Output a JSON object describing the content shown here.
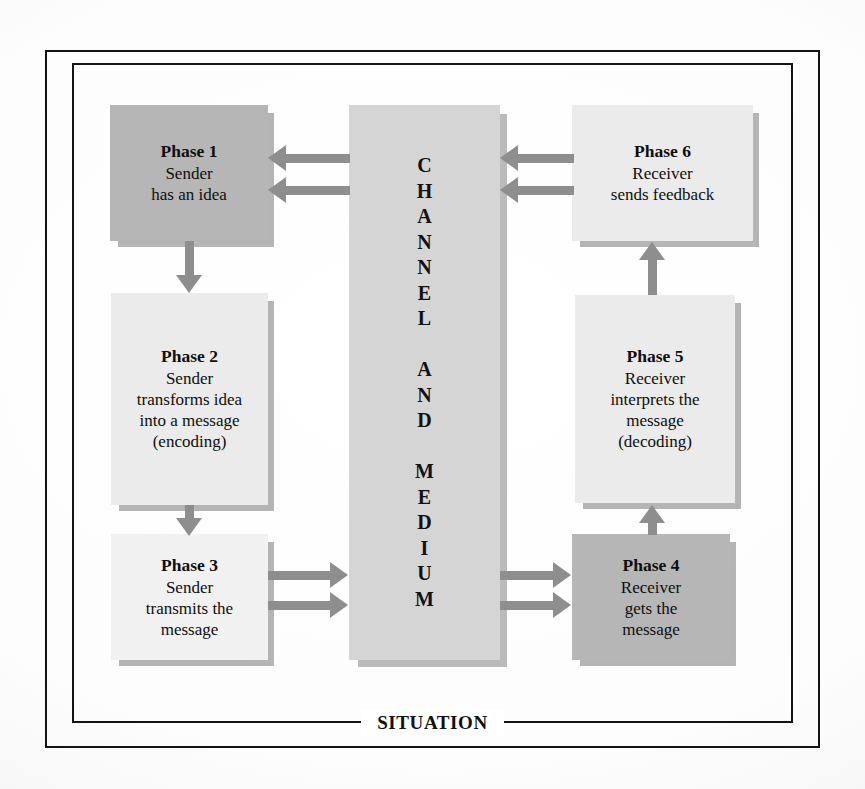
{
  "diagram": {
    "frame_label": "SITUATION",
    "channel": {
      "name": "channel-and-medium-column",
      "text": "CHANNEL AND MEDIUM",
      "letters": [
        "C",
        "H",
        "A",
        "N",
        "N",
        "E",
        "L",
        "",
        "A",
        "N",
        "D",
        "",
        "M",
        "E",
        "D",
        "I",
        "U",
        "M"
      ],
      "color": "#d5d5d5"
    },
    "nodes": [
      {
        "id": "phase-1",
        "title": "Phase 1",
        "lines": [
          "Sender",
          "has an idea"
        ],
        "tone": "dark",
        "color": "#b6b6b6"
      },
      {
        "id": "phase-2",
        "title": "Phase 2",
        "lines": [
          "Sender",
          "transforms idea",
          "into a message",
          "(encoding)"
        ],
        "tone": "light",
        "color": "#ebebeb"
      },
      {
        "id": "phase-3",
        "title": "Phase 3",
        "lines": [
          "Sender",
          "transmits the",
          "message"
        ],
        "tone": "lighter",
        "color": "#f1f1f1"
      },
      {
        "id": "phase-4",
        "title": "Phase 4",
        "lines": [
          "Receiver",
          "gets the",
          "message"
        ],
        "tone": "dark",
        "color": "#b6b6b6"
      },
      {
        "id": "phase-5",
        "title": "Phase 5",
        "lines": [
          "Receiver",
          "interprets the",
          "message",
          "(decoding)"
        ],
        "tone": "light",
        "color": "#ebebeb"
      },
      {
        "id": "phase-6",
        "title": "Phase 6",
        "lines": [
          "Receiver",
          "sends feedback"
        ],
        "tone": "light",
        "color": "#ebebeb"
      }
    ],
    "connections": [
      {
        "id": "channel-to-phase-1",
        "from": "channel",
        "to": "phase-1",
        "direction": "left",
        "style": "double"
      },
      {
        "id": "phase-1-to-phase-2",
        "from": "phase-1",
        "to": "phase-2",
        "direction": "down",
        "style": "single"
      },
      {
        "id": "phase-2-to-phase-3",
        "from": "phase-2",
        "to": "phase-3",
        "direction": "down",
        "style": "single"
      },
      {
        "id": "phase-3-to-channel",
        "from": "phase-3",
        "to": "channel",
        "direction": "right",
        "style": "double"
      },
      {
        "id": "channel-to-phase-4",
        "from": "channel",
        "to": "phase-4",
        "direction": "right",
        "style": "double"
      },
      {
        "id": "phase-4-to-phase-5",
        "from": "phase-4",
        "to": "phase-5",
        "direction": "up",
        "style": "single"
      },
      {
        "id": "phase-5-to-phase-6",
        "from": "phase-5",
        "to": "phase-6",
        "direction": "up",
        "style": "single"
      },
      {
        "id": "phase-6-to-channel",
        "from": "phase-6",
        "to": "channel",
        "direction": "left",
        "style": "double"
      }
    ],
    "arrow_color": "#8e8e8e",
    "frame_color": "#131313"
  }
}
